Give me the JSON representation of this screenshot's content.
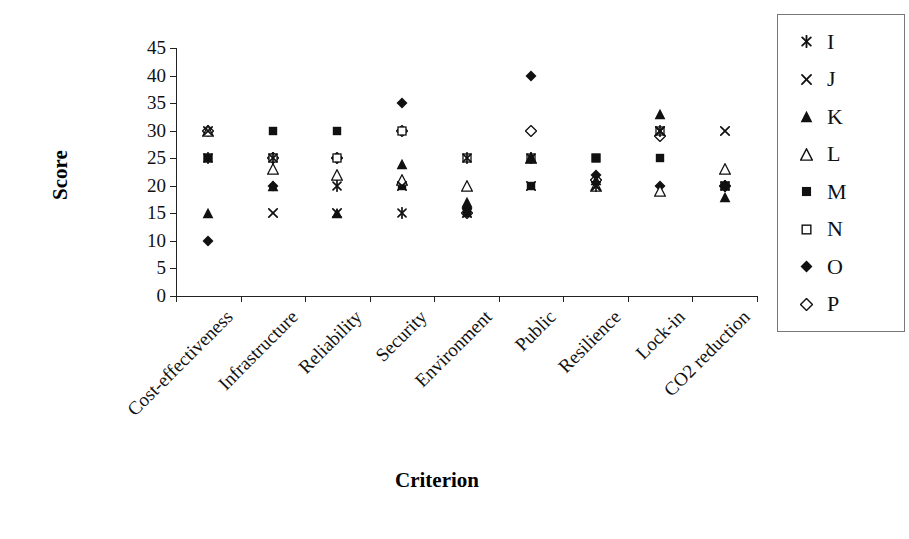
{
  "chart_data": {
    "type": "scatter",
    "title": "",
    "xlabel": "Criterion",
    "ylabel": "Score",
    "ylim": [
      0,
      45
    ],
    "ytick_step": 5,
    "grid": false,
    "legend_position": "right",
    "marker_color": "#111111",
    "categories": [
      "Cost-effectiveness",
      "Infrastructure",
      "Reliability",
      "Security",
      "Environment",
      "Public",
      "Resilience",
      "Lock-in",
      "CO2 reduction"
    ],
    "series": [
      {
        "name": "I",
        "marker": "asterisk",
        "values": [
          25,
          25,
          20,
          15,
          25,
          25,
          20,
          30,
          20
        ]
      },
      {
        "name": "J",
        "marker": "x",
        "values": [
          30,
          15,
          15,
          20,
          15,
          20,
          20,
          30,
          30
        ]
      },
      {
        "name": "K",
        "marker": "triangle-filled",
        "values": [
          15,
          20,
          15,
          24,
          17,
          25,
          21,
          33,
          18
        ]
      },
      {
        "name": "L",
        "marker": "triangle-open",
        "values": [
          30,
          23,
          22,
          21,
          20,
          25,
          20,
          19,
          23
        ]
      },
      {
        "name": "M",
        "marker": "square-filled",
        "values": [
          25,
          30,
          30,
          20,
          15,
          20,
          25,
          25,
          20
        ]
      },
      {
        "name": "N",
        "marker": "square-open",
        "values": [
          25,
          25,
          25,
          30,
          25,
          25,
          25,
          30,
          20
        ]
      },
      {
        "name": "O",
        "marker": "diamond-filled",
        "values": [
          10,
          20,
          25,
          35,
          16,
          40,
          22,
          20,
          20
        ]
      },
      {
        "name": "P",
        "marker": "diamond-open",
        "values": [
          30,
          25,
          25,
          30,
          15,
          30,
          21,
          29,
          20
        ]
      }
    ]
  }
}
